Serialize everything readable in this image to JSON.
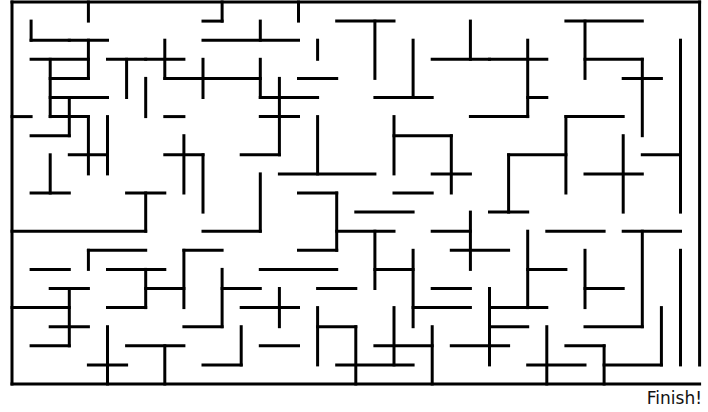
{
  "maze": {
    "origin": [
      12,
      2
    ],
    "cell": 19.1,
    "cols": 36,
    "rows": 20,
    "wall_color": "#000000",
    "wall_width": 3,
    "border": {
      "top_gaps": [],
      "left_gap_rows": [],
      "right_gap_rows": [
        19
      ]
    },
    "h_walls": [
      [
        1,
        3,
        2
      ],
      [
        1,
        4,
        3
      ],
      [
        10,
        11,
        1
      ],
      [
        17,
        20,
        1
      ],
      [
        29,
        33,
        1
      ],
      [
        3,
        5,
        2
      ],
      [
        10,
        15,
        2
      ],
      [
        5,
        7,
        3
      ],
      [
        7,
        9,
        3
      ],
      [
        2,
        4,
        4
      ],
      [
        11,
        13,
        4
      ],
      [
        8,
        12,
        4
      ],
      [
        15,
        17,
        4
      ],
      [
        2,
        5,
        5
      ],
      [
        13,
        16,
        5
      ],
      [
        27,
        28,
        5
      ],
      [
        0,
        1,
        6
      ],
      [
        2,
        4,
        6
      ],
      [
        8,
        9,
        6
      ],
      [
        13,
        15,
        6
      ],
      [
        1,
        3,
        7
      ],
      [
        3,
        5,
        8
      ],
      [
        8,
        10,
        8
      ],
      [
        12,
        14,
        8
      ],
      [
        14,
        19,
        9
      ],
      [
        1,
        3,
        10
      ],
      [
        6,
        8,
        10
      ],
      [
        15,
        17,
        10
      ],
      [
        20,
        22,
        10
      ],
      [
        0,
        7,
        12
      ],
      [
        10,
        13,
        12
      ],
      [
        17,
        20,
        12
      ],
      [
        22,
        24,
        12
      ],
      [
        4,
        7,
        13
      ],
      [
        9,
        11,
        13
      ],
      [
        15,
        17,
        13
      ],
      [
        1,
        3,
        14
      ],
      [
        5,
        8,
        14
      ],
      [
        13,
        17,
        14
      ],
      [
        19,
        21,
        14
      ],
      [
        2,
        4,
        15
      ],
      [
        7,
        9,
        15
      ],
      [
        11,
        13,
        15
      ],
      [
        16,
        18,
        15
      ],
      [
        0,
        3,
        16
      ],
      [
        5,
        7,
        16
      ],
      [
        12,
        15,
        16
      ],
      [
        21,
        24,
        16
      ],
      [
        2,
        4,
        17
      ],
      [
        9,
        11,
        17
      ],
      [
        16,
        18,
        17
      ],
      [
        25,
        27,
        17
      ],
      [
        1,
        3,
        18
      ],
      [
        6,
        9,
        18
      ],
      [
        13,
        15,
        18
      ],
      [
        19,
        22,
        18
      ],
      [
        29,
        31,
        18
      ],
      [
        4,
        6,
        19
      ],
      [
        10,
        12,
        19
      ],
      [
        27,
        30,
        19
      ],
      [
        31,
        34,
        19
      ],
      [
        22,
        25,
        3
      ],
      [
        25,
        28,
        3
      ],
      [
        30,
        33,
        3
      ],
      [
        19,
        22,
        5
      ],
      [
        24,
        27,
        6
      ],
      [
        29,
        32,
        6
      ],
      [
        20,
        23,
        7
      ],
      [
        26,
        29,
        8
      ],
      [
        30,
        33,
        9
      ],
      [
        22,
        24,
        9
      ],
      [
        25,
        27,
        11
      ],
      [
        28,
        31,
        12
      ],
      [
        18,
        21,
        11
      ],
      [
        23,
        26,
        13
      ],
      [
        27,
        29,
        14
      ],
      [
        30,
        32,
        15
      ],
      [
        22,
        24,
        15
      ],
      [
        25,
        28,
        16
      ],
      [
        30,
        33,
        17
      ],
      [
        17,
        21,
        19
      ],
      [
        23,
        26,
        18
      ],
      [
        32,
        35,
        12
      ],
      [
        33,
        35,
        8
      ],
      [
        32,
        34,
        4
      ]
    ],
    "v_walls": [
      [
        1,
        1,
        2
      ],
      [
        4,
        0,
        1
      ],
      [
        4,
        2,
        4
      ],
      [
        6,
        3,
        5
      ],
      [
        8,
        2,
        4
      ],
      [
        11,
        0,
        1
      ],
      [
        13,
        1,
        2
      ],
      [
        15,
        0,
        1
      ],
      [
        16,
        2,
        3
      ],
      [
        2,
        3,
        6
      ],
      [
        3,
        5,
        7
      ],
      [
        7,
        4,
        6
      ],
      [
        10,
        3,
        5
      ],
      [
        13,
        3,
        5
      ],
      [
        14,
        4,
        8
      ],
      [
        4,
        6,
        9
      ],
      [
        5,
        6,
        9
      ],
      [
        9,
        7,
        10
      ],
      [
        2,
        8,
        10
      ],
      [
        7,
        10,
        12
      ],
      [
        10,
        8,
        11
      ],
      [
        13,
        9,
        12
      ],
      [
        16,
        6,
        9
      ],
      [
        17,
        10,
        13
      ],
      [
        4,
        13,
        14
      ],
      [
        7,
        14,
        16
      ],
      [
        9,
        13,
        16
      ],
      [
        11,
        14,
        17
      ],
      [
        14,
        15,
        17
      ],
      [
        3,
        15,
        18
      ],
      [
        5,
        17,
        20
      ],
      [
        8,
        18,
        20
      ],
      [
        12,
        17,
        19
      ],
      [
        16,
        16,
        19
      ],
      [
        18,
        17,
        20
      ],
      [
        19,
        1,
        4
      ],
      [
        21,
        2,
        5
      ],
      [
        24,
        1,
        3
      ],
      [
        27,
        2,
        6
      ],
      [
        30,
        1,
        4
      ],
      [
        33,
        3,
        7
      ],
      [
        35,
        2,
        11
      ],
      [
        20,
        6,
        9
      ],
      [
        23,
        7,
        10
      ],
      [
        26,
        8,
        11
      ],
      [
        29,
        6,
        10
      ],
      [
        32,
        7,
        11
      ],
      [
        19,
        12,
        15
      ],
      [
        21,
        13,
        17
      ],
      [
        24,
        11,
        14
      ],
      [
        27,
        12,
        16
      ],
      [
        30,
        13,
        16
      ],
      [
        33,
        12,
        17
      ],
      [
        35,
        13,
        19
      ],
      [
        20,
        16,
        19
      ],
      [
        22,
        17,
        20
      ],
      [
        25,
        15,
        19
      ],
      [
        28,
        17,
        20
      ],
      [
        31,
        18,
        20
      ],
      [
        34,
        16,
        19
      ]
    ]
  },
  "labels": {
    "finish": "Finish!"
  }
}
